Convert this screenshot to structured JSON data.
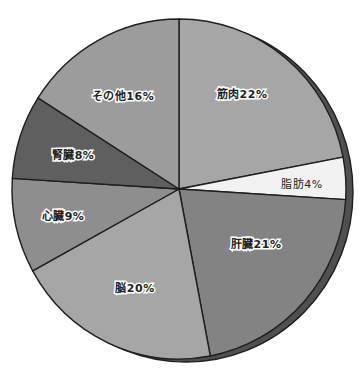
{
  "chart_data": {
    "type": "pie",
    "title": "",
    "start_angle_deg": 0,
    "direction": "clockwise",
    "categories": [
      "筋肉",
      "脂肪",
      "肝臓",
      "脳",
      "心臓",
      "腎臓",
      "その他"
    ],
    "values": [
      22,
      4,
      21,
      20,
      9,
      8,
      16
    ],
    "unit": "%",
    "labels": [
      "筋肉22%",
      "脂肪4%",
      "肝臓21%",
      "脳20%",
      "心臓9%",
      "腎臓8%",
      "その他16%"
    ],
    "colors": [
      "#a6a6a6",
      "#f2f2f2",
      "#838383",
      "#a6a6a6",
      "#8e8e8e",
      "#5f5f5f",
      "#9c9c9c"
    ],
    "label_positions": [
      [
        242,
        95
      ],
      [
        302,
        185
      ],
      [
        256,
        245
      ],
      [
        135,
        289
      ],
      [
        63,
        217
      ],
      [
        73,
        156
      ],
      [
        123,
        97
      ]
    ],
    "legend": "none",
    "grid": false,
    "style": {
      "rim_color": "#505050",
      "outline_color": "#1e1e1e"
    }
  }
}
